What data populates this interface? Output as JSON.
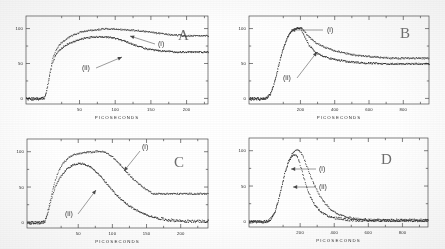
{
  "figure": {
    "panels": [
      {
        "letter": "A",
        "xlabel": "PICOSECONDS",
        "xticks": [
          50,
          100,
          150,
          200
        ],
        "yticks": [
          0,
          50,
          100
        ],
        "xlim": [
          -25,
          230
        ],
        "ylim": [
          -8,
          118
        ],
        "curve_labels": [
          "(i)",
          "(ii)"
        ]
      },
      {
        "letter": "B",
        "xlabel": "PICOSECONDS",
        "xticks": [
          200,
          400,
          600,
          800
        ],
        "yticks": [
          0,
          50,
          100
        ],
        "xlim": [
          -100,
          950
        ],
        "ylim": [
          -8,
          118
        ],
        "curve_labels": [
          "(i)",
          "(ii)"
        ]
      },
      {
        "letter": "C",
        "xlabel": "PICOSECONDS",
        "xticks": [
          50,
          100,
          150,
          200
        ],
        "yticks": [
          0,
          50,
          100
        ],
        "xlim": [
          -25,
          240
        ],
        "ylim": [
          -8,
          118
        ],
        "curve_labels": [
          "(i)",
          "(ii)"
        ]
      },
      {
        "letter": "D",
        "xlabel": "PICOSECONDS",
        "xticks": [
          200,
          400,
          600,
          800
        ],
        "yticks": [
          0,
          50,
          100
        ],
        "xlim": [
          -100,
          950
        ],
        "ylim": [
          -8,
          118
        ],
        "curve_labels": [
          "(i)",
          "(ii)"
        ]
      }
    ]
  },
  "chart_data": [
    {
      "id": "panel-a",
      "type": "scatter",
      "title": "A",
      "xlabel": "PICOSECONDS",
      "ylabel": "",
      "xlim": [
        -25,
        230
      ],
      "ylim": [
        -8,
        118
      ],
      "xticks": [
        50,
        100,
        150,
        200
      ],
      "yticks": [
        0,
        50,
        100
      ],
      "grid": false,
      "legend": "inline-annotations",
      "series": [
        {
          "name": "(i)",
          "x": [
            -25,
            -20,
            -15,
            -10,
            -5,
            0,
            3,
            6,
            9,
            12,
            16,
            20,
            25,
            30,
            36,
            42,
            50,
            58,
            66,
            74,
            82,
            90,
            98,
            106,
            114,
            122,
            130,
            138,
            146,
            152,
            158,
            166,
            174,
            182,
            190,
            198,
            206,
            214,
            222,
            228
          ],
          "y": [
            0,
            0,
            0,
            0,
            0,
            1,
            10,
            26,
            43,
            57,
            68,
            75,
            81,
            85,
            89,
            92,
            95,
            97,
            98,
            99,
            100,
            100,
            100,
            99,
            99,
            98,
            98,
            97,
            96,
            95,
            94,
            93,
            92,
            91,
            91,
            90,
            90,
            90,
            90,
            90
          ]
        },
        {
          "name": "(ii)",
          "x": [
            -25,
            -20,
            -15,
            -10,
            -5,
            0,
            3,
            6,
            9,
            12,
            16,
            20,
            25,
            30,
            36,
            42,
            50,
            58,
            66,
            74,
            82,
            90,
            98,
            106,
            114,
            122,
            130,
            138,
            146,
            152,
            158,
            166,
            174,
            182,
            190,
            198,
            206,
            214,
            222,
            228
          ],
          "y": [
            0,
            0,
            0,
            0,
            0,
            1,
            9,
            24,
            40,
            53,
            62,
            68,
            73,
            77,
            80,
            82,
            85,
            87,
            88,
            89,
            89,
            88,
            87,
            85,
            82,
            79,
            76,
            73,
            71,
            70,
            69,
            68,
            68,
            67,
            67,
            67,
            67,
            67,
            67,
            67
          ]
        }
      ]
    },
    {
      "id": "panel-b",
      "type": "scatter",
      "title": "B",
      "xlabel": "PICOSECONDS",
      "ylabel": "",
      "xlim": [
        -100,
        950
      ],
      "ylim": [
        -8,
        118
      ],
      "xticks": [
        200,
        400,
        600,
        800
      ],
      "yticks": [
        0,
        50,
        100
      ],
      "grid": false,
      "legend": "inline-annotations",
      "series": [
        {
          "name": "(i)",
          "x": [
            -100,
            -80,
            -60,
            -40,
            -20,
            0,
            20,
            40,
            60,
            80,
            100,
            120,
            140,
            160,
            180,
            200,
            220,
            250,
            290,
            330,
            380,
            430,
            480,
            530,
            580,
            630,
            680,
            730,
            780,
            830,
            880,
            930
          ],
          "y": [
            0,
            0,
            0,
            0,
            0,
            1,
            6,
            18,
            36,
            57,
            74,
            87,
            95,
            99,
            101,
            102,
            97,
            88,
            80,
            75,
            70,
            67,
            64,
            62,
            61,
            60,
            59,
            58,
            58,
            58,
            58,
            58
          ]
        },
        {
          "name": "(ii)",
          "x": [
            -100,
            -80,
            -60,
            -40,
            -20,
            0,
            20,
            40,
            60,
            80,
            100,
            120,
            140,
            160,
            180,
            200,
            220,
            250,
            290,
            330,
            380,
            430,
            480,
            530,
            580,
            630,
            680,
            730,
            780,
            830,
            880,
            930
          ],
          "y": [
            0,
            0,
            0,
            0,
            0,
            1,
            6,
            18,
            36,
            57,
            74,
            87,
            95,
            99,
            101,
            101,
            90,
            76,
            66,
            61,
            57,
            55,
            53,
            52,
            51,
            51,
            50,
            50,
            50,
            50,
            50,
            50
          ]
        }
      ]
    },
    {
      "id": "panel-c",
      "type": "scatter",
      "title": "C",
      "xlabel": "PICOSECONDS",
      "ylabel": "",
      "xlim": [
        -25,
        240
      ],
      "ylim": [
        -8,
        118
      ],
      "xticks": [
        50,
        100,
        150,
        200
      ],
      "yticks": [
        0,
        50,
        100
      ],
      "grid": false,
      "legend": "inline-annotations",
      "series": [
        {
          "name": "(i)",
          "x": [
            -25,
            -18,
            -12,
            -6,
            0,
            4,
            8,
            12,
            17,
            22,
            28,
            34,
            40,
            46,
            52,
            58,
            64,
            70,
            76,
            82,
            88,
            94,
            100,
            106,
            112,
            118,
            124,
            130,
            136,
            142,
            148,
            154,
            160
          ],
          "y": [
            0,
            0,
            0,
            0,
            1,
            12,
            30,
            48,
            64,
            76,
            85,
            91,
            95,
            97,
            98,
            99,
            100,
            100,
            101,
            101,
            100,
            97,
            93,
            87,
            81,
            74,
            68,
            62,
            57,
            52,
            48,
            44,
            41
          ]
        },
        {
          "name": "(ii)",
          "x": [
            -25,
            -18,
            -12,
            -6,
            0,
            4,
            8,
            12,
            17,
            22,
            28,
            34,
            40,
            46,
            52,
            58,
            64,
            70,
            76,
            82,
            88,
            94,
            100,
            108,
            116,
            124,
            134,
            144,
            156,
            168,
            180,
            195,
            210,
            225,
            238
          ],
          "y": [
            0,
            0,
            0,
            0,
            1,
            10,
            25,
            40,
            53,
            63,
            71,
            77,
            81,
            83,
            84,
            83,
            81,
            77,
            72,
            66,
            59,
            52,
            45,
            37,
            30,
            24,
            18,
            13,
            9,
            6,
            4,
            3,
            2,
            2,
            2
          ]
        }
      ]
    },
    {
      "id": "panel-d",
      "type": "scatter",
      "title": "D",
      "xlabel": "PICOSECONDS",
      "ylabel": "",
      "xlim": [
        -100,
        950
      ],
      "ylim": [
        -8,
        118
      ],
      "xticks": [
        200,
        400,
        600,
        800
      ],
      "yticks": [
        0,
        50,
        100
      ],
      "grid": false,
      "legend": "inline-annotations",
      "series": [
        {
          "name": "(i)",
          "x": [
            -100,
            -70,
            -40,
            -10,
            10,
            30,
            50,
            70,
            90,
            110,
            130,
            150,
            170,
            185,
            200,
            215,
            235,
            255,
            280,
            310,
            340,
            375,
            410,
            450,
            500,
            560,
            620,
            690,
            760,
            830,
            900,
            945
          ],
          "y": [
            0,
            0,
            0,
            0,
            1,
            5,
            14,
            30,
            50,
            70,
            86,
            96,
            101,
            102,
            99,
            92,
            80,
            67,
            53,
            38,
            27,
            18,
            12,
            8,
            5,
            3,
            2,
            2,
            2,
            2,
            2,
            2
          ]
        },
        {
          "name": "(ii)",
          "x": [
            -100,
            -70,
            -40,
            -10,
            10,
            30,
            50,
            70,
            90,
            110,
            130,
            150,
            165,
            180,
            195,
            210,
            230,
            255,
            285,
            320,
            360,
            410,
            470,
            540,
            620,
            700,
            790,
            870,
            945
          ],
          "y": [
            0,
            0,
            0,
            0,
            1,
            5,
            14,
            30,
            50,
            70,
            85,
            93,
            95,
            92,
            83,
            70,
            54,
            37,
            23,
            14,
            8,
            5,
            3,
            2,
            2,
            2,
            2,
            2,
            2
          ]
        }
      ]
    }
  ]
}
